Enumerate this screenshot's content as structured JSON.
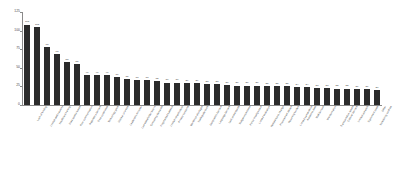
{
  "chart_data": {
    "type": "bar",
    "title": "",
    "subtitle": "",
    "xlabel": "",
    "ylabel": "Number of Responses",
    "ylim": [
      0,
      125
    ],
    "yticks": [
      0,
      25,
      50,
      75,
      100,
      125
    ],
    "grid": false,
    "legend": null,
    "orientation": "vertical",
    "bar_color": "#2b2b2b",
    "value_labels": true,
    "categories": [
      "Lack of funding",
      "Limited staff capacity",
      "Insufficient training",
      "Data quality issues",
      "Poor communication",
      "Regulatory barriers",
      "Time constraints",
      "Technology gaps",
      "Unclear priorities",
      "Leadership turnover",
      "Low stakeholder buy-in",
      "Competing demands",
      "Fragmented systems",
      "Limited infrastructure",
      "Privacy concerns",
      "Workforce shortages",
      "Inadequate tools",
      "Geographic barriers",
      "Language barriers",
      "Lack of standards",
      "Budget uncertainty",
      "Policy misalignment",
      "Limited evaluation",
      "Resistance to change",
      "Procurement delays",
      "Reporting burden",
      "Limited partnerships",
      "Access to data",
      "Staff burnout",
      "Misinformation",
      "Transportation issues",
      "Cultural barriers",
      "Limited outreach",
      "Equipment costs",
      "Scheduling conflicts",
      "Other"
    ],
    "values": [
      108,
      105,
      78,
      68,
      58,
      55,
      40,
      40,
      40,
      37,
      35,
      33,
      33,
      32,
      30,
      30,
      29,
      29,
      28,
      28,
      27,
      26,
      26,
      26,
      25,
      25,
      25,
      24,
      24,
      23,
      23,
      22,
      22,
      21,
      21,
      20
    ]
  }
}
